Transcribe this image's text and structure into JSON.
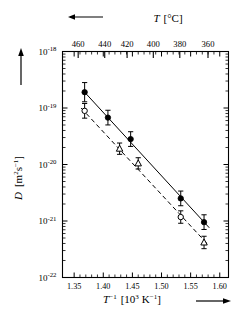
{
  "figure": {
    "background": "#ffffff",
    "ink": "#000000"
  },
  "chart_data": {
    "type": "scatter",
    "title": "",
    "xlabel": "T^-1  [10^3 K^-1]",
    "ylabel": "D  [m^2 s^-1]",
    "xlim": [
      1.33,
      1.615
    ],
    "ylim_exp": [
      -22,
      -18
    ],
    "yscale": "log",
    "grid": false,
    "legend": "none",
    "x_ticks": [
      "1.35",
      "1.40",
      "1.45",
      "1.50",
      "1.55",
      "1.60"
    ],
    "x_tick_values": [
      1.35,
      1.4,
      1.45,
      1.5,
      1.55,
      1.6
    ],
    "y_ticks": [
      "10^-18",
      "10^-19",
      "10^-20",
      "10^-21",
      "10^-22"
    ],
    "y_tick_exponents": [
      -18,
      -19,
      -20,
      -21,
      -22
    ],
    "secondary_axis": {
      "label": "T  [°C]",
      "units": "°C",
      "direction": "decreasing-rightward",
      "arrow": "left",
      "ticks": [
        "460",
        "440",
        "420",
        "400",
        "380",
        "360"
      ],
      "tick_values": [
        460,
        440,
        420,
        400,
        380,
        360
      ],
      "tick_x": [
        1.3569,
        1.4025,
        1.4409,
        1.4859,
        1.5314,
        1.5798
      ]
    },
    "series": [
      {
        "name": "filled-circles",
        "marker": "filled-circle",
        "line": "solid",
        "points": [
          {
            "x": 1.368,
            "y_exp": -18.72,
            "err_exp": 0.17
          },
          {
            "x": 1.408,
            "y_exp": -19.17,
            "err_exp": 0.13
          },
          {
            "x": 1.447,
            "y_exp": -19.55,
            "err_exp": 0.13
          },
          {
            "x": 1.533,
            "y_exp": -20.6,
            "err_exp": 0.13
          },
          {
            "x": 1.573,
            "y_exp": -21.02,
            "err_exp": 0.13
          }
        ]
      },
      {
        "name": "open-symbols",
        "marker": "open-circle-and-triangle",
        "line": "dashed",
        "points": [
          {
            "x": 1.368,
            "y_exp": -19.05,
            "err_exp": 0.13,
            "marker": "open-circle"
          },
          {
            "x": 1.428,
            "y_exp": -19.72,
            "err_exp": 0.1,
            "marker": "open-triangle"
          },
          {
            "x": 1.46,
            "y_exp": -19.98,
            "err_exp": 0.1,
            "marker": "open-triangle"
          },
          {
            "x": 1.533,
            "y_exp": -20.93,
            "err_exp": 0.11,
            "marker": "open-circle"
          },
          {
            "x": 1.573,
            "y_exp": -21.38,
            "err_exp": 0.11,
            "marker": "open-triangle"
          }
        ]
      }
    ],
    "fit_lines": [
      {
        "name": "solid-fit",
        "style": "solid",
        "x0": 1.368,
        "y0_exp": -18.72,
        "x1": 1.582,
        "y1_exp": -21.12
      },
      {
        "name": "dashed-fit",
        "style": "dashed",
        "x0": 1.362,
        "y0_exp": -19.0,
        "x1": 1.58,
        "y1_exp": -21.42
      }
    ],
    "axis_arrows": {
      "y_axis": "up",
      "x_axis": "right",
      "top_axis": "left"
    }
  }
}
